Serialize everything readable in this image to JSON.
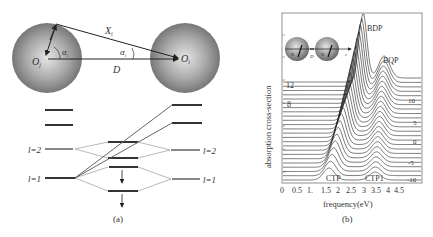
{
  "figure": {
    "panel_a": {
      "caption": "(a)",
      "labels": {
        "X_i": "X",
        "X_i_sub": "i",
        "alpha_left": "α",
        "alpha_left_sub": "i",
        "alpha_right": "α",
        "alpha_right_sub": "i",
        "O_j": "O",
        "O_j_sub": "j",
        "O_i": "O",
        "O_i_sub": "i",
        "D": "D"
      },
      "level_labels": {
        "left_l2": "l=2",
        "left_l1": "l=1",
        "right_l2": "l=2",
        "right_l1": "l=1"
      }
    },
    "panel_b": {
      "caption": "(b)",
      "xlabel": "frequency(eV)",
      "ylabel": "absorption cross-section",
      "xticks": [
        "0",
        "0.5",
        "1.",
        "1.5",
        "2",
        "2.5",
        "3",
        "3.5",
        "4",
        "4.5"
      ],
      "right_labels": [
        "10",
        "5",
        "0",
        "-5",
        "-10"
      ],
      "left_labels": [
        "12",
        "8"
      ],
      "peak_labels": {
        "bdp": "BDP",
        "bqp": "BQP",
        "ctp": "CTP",
        "ctp1": "CTP1"
      },
      "inset": {
        "R_left": "R",
        "D": "D",
        "R_right": "R",
        "z": "z"
      }
    }
  },
  "chart_data": {
    "type": "line",
    "title": "",
    "xlabel": "frequency(eV)",
    "ylabel": "absorption cross-section",
    "xlim": [
      0,
      4.5
    ],
    "x_ticks": [
      0,
      0.5,
      1,
      1.5,
      2,
      2.5,
      3,
      3.5,
      4,
      4.5
    ],
    "waterfall": true,
    "curve_parameter_labels": [
      "12",
      "10",
      "8",
      "5",
      "0",
      "-5",
      "-10"
    ],
    "annotations": [
      {
        "text": "BDP",
        "x": 2.6,
        "note": "bonding dipole plasmon peak, top curves"
      },
      {
        "text": "BQP",
        "x": 3.3,
        "note": "bonding quadrupole plasmon peak"
      },
      {
        "text": "CTP",
        "x": 1.5,
        "note": "charge transfer plasmon, bottom curves"
      },
      {
        "text": "CTP1",
        "x": 3.0,
        "note": "second charge transfer plasmon"
      }
    ],
    "series_note": "Stacked offset spectra; peak near 2.6 eV for top curves (BDP) shifting to ~1.5 eV (CTP) for lower curves; secondary peak ~3.3 eV (BQP) to ~3.0 eV (CTP1)"
  }
}
